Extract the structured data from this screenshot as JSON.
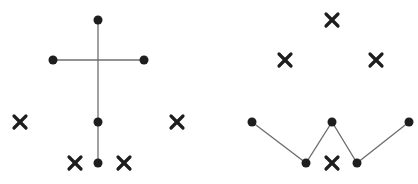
{
  "diagrams": [
    {
      "id": "left",
      "description": "Cross-shaped tree: vertical stem with a horizontal crossbar, four dot nodes, surrounded by four X marks",
      "nodes": [
        {
          "id": "top",
          "x": 98,
          "y": 20
        },
        {
          "id": "bar-left",
          "x": 53,
          "y": 60
        },
        {
          "id": "bar-right",
          "x": 144,
          "y": 60
        },
        {
          "id": "middle",
          "x": 98,
          "y": 122
        },
        {
          "id": "bottom",
          "x": 98,
          "y": 163
        }
      ],
      "edges": [
        {
          "from": [
            98,
            20
          ],
          "to": [
            98,
            163
          ]
        },
        {
          "from": [
            53,
            60
          ],
          "to": [
            144,
            60
          ]
        }
      ],
      "x_marks": [
        {
          "x": 20,
          "y": 122
        },
        {
          "x": 177,
          "y": 122
        },
        {
          "x": 75,
          "y": 163
        },
        {
          "x": 124,
          "y": 163
        }
      ]
    },
    {
      "id": "right",
      "description": "Zigzag (W-shaped) path of five dot nodes with four X marks arranged above and below",
      "nodes": [
        {
          "id": "n1",
          "x": 252,
          "y": 122
        },
        {
          "id": "n2",
          "x": 306,
          "y": 163
        },
        {
          "id": "n3",
          "x": 332,
          "y": 122
        },
        {
          "id": "n4",
          "x": 357,
          "y": 163
        },
        {
          "id": "n5",
          "x": 409,
          "y": 122
        }
      ],
      "path": [
        [
          252,
          122
        ],
        [
          306,
          163
        ],
        [
          332,
          122
        ],
        [
          357,
          163
        ],
        [
          409,
          122
        ]
      ],
      "x_marks": [
        {
          "x": 332,
          "y": 20
        },
        {
          "x": 285,
          "y": 60
        },
        {
          "x": 376,
          "y": 60
        },
        {
          "x": 332,
          "y": 163
        }
      ]
    }
  ]
}
